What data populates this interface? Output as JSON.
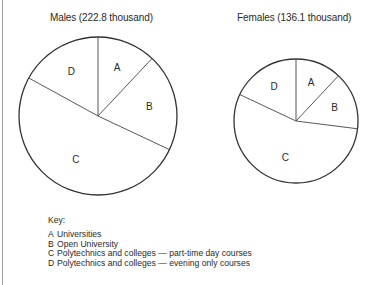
{
  "chart_data": [
    {
      "type": "pie",
      "title": "Males (222.8 thousand)",
      "categories": [
        "A",
        "B",
        "C",
        "D"
      ],
      "values": [
        12,
        20,
        51,
        17
      ],
      "units": "approximate percent of total (estimated from slice angles)",
      "start_angle_deg": 0,
      "direction": "clockwise",
      "center": [
        98,
        116
      ],
      "radius": 79
    },
    {
      "type": "pie",
      "title": "Females (136.1 thousand)",
      "categories": [
        "A",
        "B",
        "C",
        "D"
      ],
      "values": [
        12,
        15,
        55,
        18
      ],
      "units": "approximate percent of total (estimated from slice angles)",
      "start_angle_deg": 0,
      "direction": "clockwise",
      "center": [
        296,
        121
      ],
      "radius": 62
    }
  ],
  "charts": {
    "males": {
      "title": "Males (222.8 thousand)"
    },
    "females": {
      "title": "Females (136.1 thousand)"
    }
  },
  "key": {
    "title": "Key:",
    "items": [
      {
        "letter": "A",
        "label": "Universities"
      },
      {
        "letter": "B",
        "label": "Open University"
      },
      {
        "letter": "C",
        "label": "Polytechnics and colleges — part-time day courses"
      },
      {
        "letter": "D",
        "label": "Polytechnics and colleges — evening only courses"
      }
    ]
  }
}
